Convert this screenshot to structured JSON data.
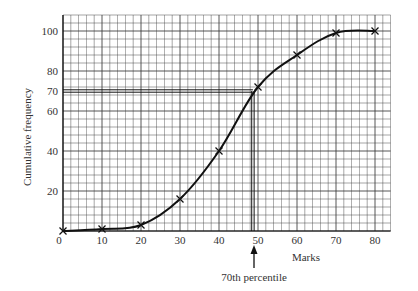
{
  "chart_data": {
    "type": "line",
    "title": "",
    "xlabel": "Marks",
    "ylabel": "Cumulative frequency",
    "x": [
      0,
      10,
      20,
      30,
      40,
      50,
      60,
      70,
      80
    ],
    "series": [
      {
        "name": "Cumulative frequency",
        "values": [
          0,
          1,
          3,
          16,
          40,
          72,
          88,
          99,
          100
        ],
        "marker": "x"
      }
    ],
    "x_ticks": [
      "0",
      "10",
      "20",
      "30",
      "40",
      "50",
      "60",
      "70",
      "80"
    ],
    "y_ticks": [
      "20",
      "40",
      "60",
      "70",
      "80",
      "100"
    ],
    "xlim": [
      0,
      84
    ],
    "ylim": [
      0,
      108
    ],
    "grid": true,
    "annotations": [
      {
        "type": "hline",
        "y": 70,
        "x_end": 48.7,
        "label": ""
      },
      {
        "type": "vline",
        "x": 48.7,
        "y_end": 70,
        "label": ""
      },
      {
        "type": "arrow",
        "x": 48.7,
        "text": "70th percentile"
      }
    ]
  },
  "labels": {
    "xlabel": "Marks",
    "ylabel": "Cumulative frequency",
    "annotation": "70th percentile",
    "origin": "0"
  },
  "colors": {
    "grid": "#3a3a3a",
    "curve": "#111111",
    "text": "#333333"
  }
}
